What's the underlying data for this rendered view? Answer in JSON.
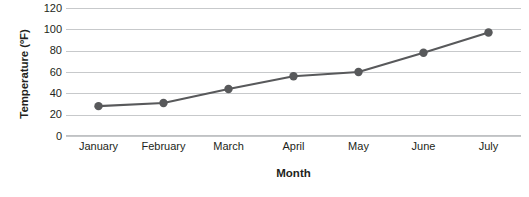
{
  "chart_data": {
    "type": "line",
    "title": "",
    "subtitle": "",
    "xlabel": "Month",
    "ylabel": "Temperature (ºF)",
    "categories": [
      "January",
      "February",
      "March",
      "April",
      "May",
      "June",
      "July"
    ],
    "values": [
      28,
      31,
      44,
      56,
      60,
      78,
      97
    ],
    "series": [
      {
        "name": "Temperature",
        "values": [
          28,
          31,
          44,
          56,
          60,
          78,
          97
        ]
      }
    ],
    "ylim": [
      0,
      120
    ],
    "yticks": [
      0,
      20,
      40,
      60,
      80,
      100,
      120
    ],
    "ytick_labels": [
      "0",
      "20",
      "40",
      "60",
      "80",
      "100",
      "120"
    ],
    "grid": "horizontal",
    "legend": "none",
    "colors": {
      "line": "#58595b",
      "marker": "#58595b",
      "gridline": "#c7c9cb",
      "axis": "#c0c2c4",
      "text": "#231f20",
      "background": "#ffffff"
    },
    "marker_style": "circle"
  }
}
